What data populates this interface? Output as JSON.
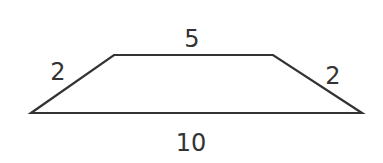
{
  "figure": {
    "shape": "trapezoid",
    "stroke_color": "#333333",
    "background": "#ffffff",
    "vertices": {
      "bottom_left": [
        31,
        113
      ],
      "top_left": [
        114,
        55
      ],
      "top_right": [
        273,
        55
      ],
      "bottom_right": [
        362,
        113
      ]
    },
    "labels": {
      "top": "5",
      "left": "2",
      "right": "2",
      "bottom": "10"
    }
  }
}
